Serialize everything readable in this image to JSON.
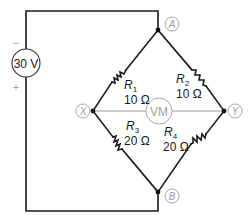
{
  "diagram": {
    "type": "wheatstone-bridge-circuit",
    "source": {
      "label": "30 V",
      "negative_sign": "−",
      "positive_sign": "+"
    },
    "nodes": {
      "A": "A",
      "B": "B",
      "X": "X",
      "Y": "Y"
    },
    "resistors": [
      {
        "name": "R",
        "sub": "1",
        "value": "10 Ω",
        "between": "A-X"
      },
      {
        "name": "R",
        "sub": "2",
        "value": "10 Ω",
        "between": "A-Y"
      },
      {
        "name": "R",
        "sub": "3",
        "value": "20 Ω",
        "between": "X-B"
      },
      {
        "name": "R",
        "sub": "4",
        "value": "20 Ω",
        "between": "Y-B"
      }
    ],
    "meter": {
      "label": "VM",
      "between": "X-Y"
    },
    "colors": {
      "wire": "#1a1a1a",
      "meter": "#9a9a9a",
      "node_label": "#a0a0a0"
    }
  }
}
